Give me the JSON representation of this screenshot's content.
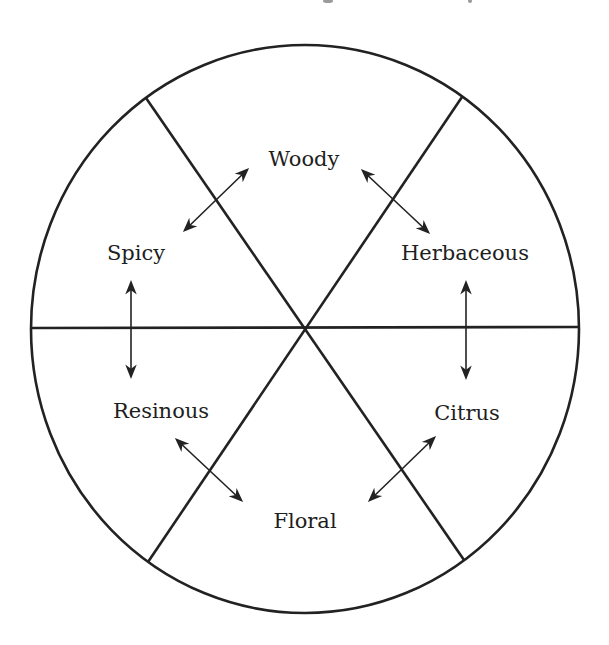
{
  "diagram": {
    "type": "fragrance-family-wheel",
    "segments": [
      {
        "id": "woody",
        "label": "Woody"
      },
      {
        "id": "herbaceous",
        "label": "Herbaceous"
      },
      {
        "id": "citrus",
        "label": "Citrus"
      },
      {
        "id": "floral",
        "label": "Floral"
      },
      {
        "id": "resinous",
        "label": "Resinous"
      },
      {
        "id": "spicy",
        "label": "Spicy"
      }
    ],
    "relationships": [
      {
        "from": "Spicy",
        "to": "Woody",
        "type": "bidirectional-arrow"
      },
      {
        "from": "Woody",
        "to": "Herbaceous",
        "type": "bidirectional-arrow"
      },
      {
        "from": "Herbaceous",
        "to": "Citrus",
        "type": "bidirectional-arrow"
      },
      {
        "from": "Citrus",
        "to": "Floral",
        "type": "bidirectional-arrow"
      },
      {
        "from": "Floral",
        "to": "Resinous",
        "type": "bidirectional-arrow"
      },
      {
        "from": "Resinous",
        "to": "Spicy",
        "type": "bidirectional-arrow"
      }
    ],
    "colors": {
      "line": "#222222",
      "text": "#1e1e1e",
      "background": "#ffffff"
    }
  }
}
